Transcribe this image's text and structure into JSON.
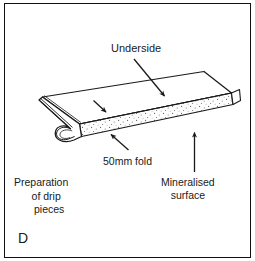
{
  "figure": {
    "panel_letter": "D",
    "caption_lines": [
      "Preparation",
      "of drip",
      "pieces"
    ],
    "labels": {
      "underside": "Underside",
      "fold": "50mm fold",
      "mineralised_line1": "Mineralised",
      "mineralised_line2": "surface"
    },
    "colors": {
      "frame": "#111111",
      "line": "#1a1a1a",
      "text": "#1a1a1a",
      "background": "#ffffff",
      "speckle": "#555555",
      "mineralised_fill": "#fdfdfd"
    }
  }
}
